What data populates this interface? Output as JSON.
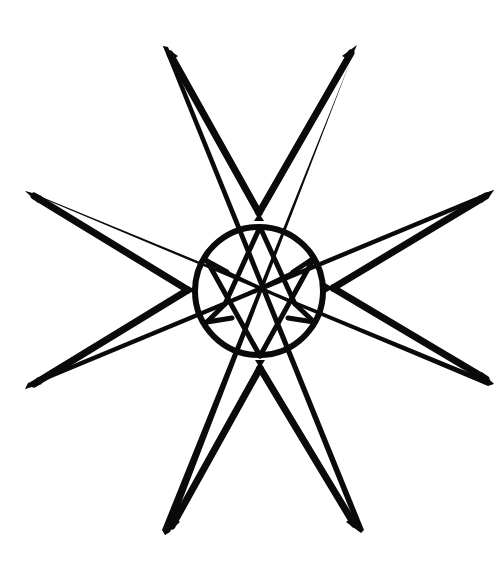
{
  "figure": {
    "title": "",
    "background_color": "#ffffff",
    "ink_color": "#0a0a0a"
  },
  "elements": {
    "arms": [
      {
        "name": "top-arm",
        "tips": [
          [
            163,
            46
          ],
          [
            357,
            45
          ]
        ],
        "apex": [
          259,
          213
        ]
      },
      {
        "name": "left-arm",
        "tips": [
          [
            25,
            191
          ],
          [
            25,
            389
          ]
        ],
        "apex": [
          188,
          290
        ]
      },
      {
        "name": "right-arm",
        "tips": [
          [
            494,
            190
          ],
          [
            494,
            384
          ]
        ],
        "apex": [
          333,
          288
        ]
      },
      {
        "name": "bottom-arm",
        "tips": [
          [
            165,
            535
          ],
          [
            361,
            533
          ]
        ],
        "apex": [
          260,
          368
        ]
      }
    ],
    "center_circle": {
      "cx": 259,
      "cy": 291,
      "r": 64
    },
    "hexagram": "unicursal hexagram"
  }
}
